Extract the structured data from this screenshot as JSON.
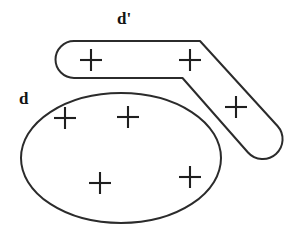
{
  "figure": {
    "title": "",
    "background_color": "#ffffff",
    "stroke_color": "#2b2b2b",
    "width": 293,
    "height": 231
  },
  "labels": {
    "d_prime": "d'",
    "d": "d"
  },
  "regions": [
    {
      "name": "d-prime-region",
      "label": "d'",
      "shape": "bent-rounded-band",
      "plus_count": 3
    },
    {
      "name": "d-region",
      "label": "d",
      "shape": "ellipse",
      "plus_count": 4
    }
  ],
  "markers": {
    "glyph": "+",
    "color": "#1f1f1f",
    "band_points": [
      {
        "name": "band-plus-left",
        "x": 91,
        "y": 60,
        "size": 11
      },
      {
        "name": "band-plus-right",
        "x": 190,
        "y": 60,
        "size": 11
      },
      {
        "name": "band-plus-arm",
        "x": 236,
        "y": 107,
        "size": 11
      }
    ],
    "ellipse_points": [
      {
        "name": "ellipse-plus-upper-left",
        "x": 65,
        "y": 118,
        "size": 11
      },
      {
        "name": "ellipse-plus-upper-mid",
        "x": 128,
        "y": 117,
        "size": 11
      },
      {
        "name": "ellipse-plus-lower-left",
        "x": 100,
        "y": 183,
        "size": 11
      },
      {
        "name": "ellipse-plus-lower-right",
        "x": 190,
        "y": 177,
        "size": 11
      }
    ]
  },
  "geometry": {
    "ellipse": {
      "cx": 121,
      "cy": 158,
      "rx": 100,
      "ry": 65
    },
    "band_path": "M 74 41 L 200 41 L 277 126 A 19 19 0 0 1 248 152 L 182 78 L 74 78 A 18.5 18.5 0 0 1 74 41 Z"
  }
}
